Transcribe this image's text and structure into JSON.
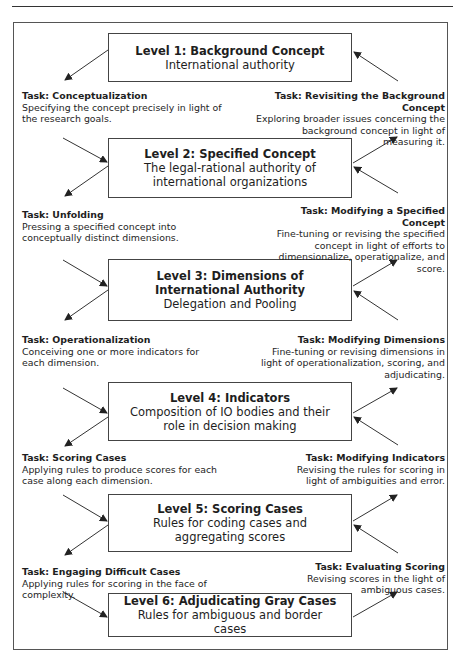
{
  "diagram": {
    "levels": [
      {
        "title": "Level 1: Background Concept",
        "desc": "International authority"
      },
      {
        "title": "Level 2: Specified Concept",
        "desc": "The legal-rational authority of international organizations"
      },
      {
        "title": "Level 3: Dimensions of International Authority",
        "desc": "Delegation and Pooling"
      },
      {
        "title": "Level 4: Indicators",
        "desc": "Composition of IO bodies and their role in decision making"
      },
      {
        "title": "Level 5: Scoring Cases",
        "desc": "Rules for coding cases and aggregating scores"
      },
      {
        "title": "Level 6: Adjudicating Gray Cases",
        "desc": "Rules for ambiguous and border cases"
      }
    ],
    "down_tasks": [
      {
        "title": "Task: Conceptualization",
        "desc": "Specifying the concept precisely in light of the research goals."
      },
      {
        "title": "Task: Unfolding",
        "desc": "Pressing a specified concept into conceptually distinct dimensions."
      },
      {
        "title": "Task: Operationalization",
        "desc": "Conceiving one or more indicators for each dimension."
      },
      {
        "title": "Task: Scoring Cases",
        "desc": "Applying rules to produce scores for each case along each dimension."
      },
      {
        "title": "Task: Engaging Difficult Cases",
        "desc": "Applying rules for scoring in the face of complexity."
      }
    ],
    "up_tasks": [
      {
        "title": "Task: Revisiting the Background Concept",
        "desc": "Exploring broader issues concerning the background concept in light of measuring it."
      },
      {
        "title": "Task: Modifying a Specified Concept",
        "desc": "Fine-tuning or revising the specified concept in light of efforts to dimensionalize, operationalize, and score."
      },
      {
        "title": "Task: Modifying Dimensions",
        "desc": "Fine-tuning or revising dimensions in light of operationalization, scoring, and adjudicating."
      },
      {
        "title": "Task: Modifying Indicators",
        "desc": "Revising the rules for scoring in light of ambiguities and error."
      },
      {
        "title": "Task: Evaluating Scoring",
        "desc": "Revising scores in the light of ambiguous cases."
      }
    ]
  }
}
